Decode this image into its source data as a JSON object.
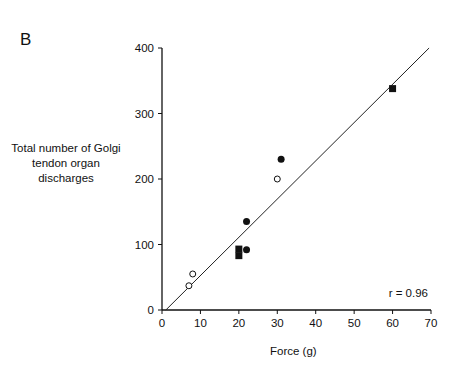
{
  "panel_label": "B",
  "chart_data": {
    "type": "scatter",
    "title": "",
    "xlabel": "Force (g)",
    "ylabel": "Total number of Golgi tendon organ discharges",
    "xlim": [
      0,
      70
    ],
    "ylim": [
      0,
      400
    ],
    "xticks": [
      0,
      10,
      20,
      30,
      40,
      50,
      60,
      70
    ],
    "yticks": [
      0,
      100,
      200,
      300,
      400
    ],
    "grid": false,
    "legend": null,
    "series": [
      {
        "name": "open circles",
        "marker": "open-circle",
        "points": [
          [
            7,
            37
          ],
          [
            8,
            55
          ],
          [
            30,
            200
          ]
        ]
      },
      {
        "name": "filled circles",
        "marker": "filled-circle",
        "points": [
          [
            22,
            135
          ],
          [
            22,
            92
          ],
          [
            31,
            230
          ]
        ]
      },
      {
        "name": "filled squares",
        "marker": "filled-square",
        "points": [
          [
            20,
            93
          ],
          [
            20,
            83
          ],
          [
            60,
            338
          ]
        ]
      }
    ],
    "regression_line": {
      "x": [
        1,
        69.5
      ],
      "y": [
        0,
        400
      ]
    },
    "annotation": "r = 0.96"
  }
}
